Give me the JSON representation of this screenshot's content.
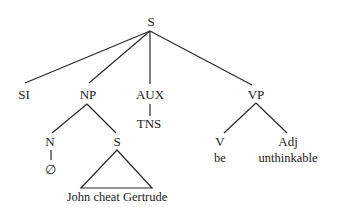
{
  "diagram": {
    "type": "syntax-tree",
    "root": {
      "label": "S",
      "children": [
        {
          "label": "SI"
        },
        {
          "label": "NP",
          "children": [
            {
              "label": "N",
              "children": [
                {
                  "label": "∅"
                }
              ]
            },
            {
              "label": "S",
              "children": [
                {
                  "label": "John cheat Gertrude",
                  "triangle": true
                }
              ]
            }
          ]
        },
        {
          "label": "AUX",
          "children": [
            {
              "label": "TNS"
            }
          ]
        },
        {
          "label": "VP",
          "children": [
            {
              "label": "V",
              "children": [
                {
                  "label": "be"
                }
              ]
            },
            {
              "label": "Adj",
              "children": [
                {
                  "label": "unthinkable"
                }
              ]
            }
          ]
        }
      ]
    }
  },
  "labels": {
    "s_root": "S",
    "si": "SI",
    "np": "NP",
    "aux": "AUX",
    "vp": "VP",
    "n": "N",
    "null": "∅",
    "s_embedded": "S",
    "embedded_text": "John cheat Gertrude",
    "tns": "TNS",
    "v": "V",
    "be": "be",
    "adj": "Adj",
    "unthinkable": "unthinkable"
  }
}
